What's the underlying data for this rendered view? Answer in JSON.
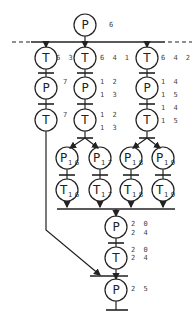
{
  "diagram": {
    "type": "petri-net",
    "top_place": {
      "letter": "P",
      "label": "6"
    },
    "branches": [
      {
        "t1": {
          "letter": "T",
          "label": "6 3"
        },
        "p": {
          "letter": "P",
          "label": "7"
        },
        "t2": {
          "letter": "T",
          "label": "7"
        }
      },
      {
        "t1": {
          "letter": "T",
          "label": "6 4 1"
        },
        "p": {
          "letter": "P",
          "label_lines": [
            "1 2",
            "1 3"
          ]
        },
        "t2": {
          "letter": "T",
          "label_lines": [
            "1 2",
            "1 3"
          ]
        }
      },
      {
        "t1": {
          "letter": "T",
          "label": "6 4 2"
        },
        "p": {
          "letter": "P",
          "label_lines": [
            "1 4",
            "1 5"
          ]
        },
        "t2": {
          "letter": "T",
          "label_lines": [
            "1 4",
            "1 5"
          ]
        }
      }
    ],
    "parallel_places": [
      {
        "letter": "P",
        "sub": "1 6"
      },
      {
        "letter": "P",
        "sub": "1 7"
      },
      {
        "letter": "P",
        "sub": "1 8"
      },
      {
        "letter": "P",
        "sub": "1 9"
      }
    ],
    "parallel_transitions": [
      {
        "letter": "T",
        "sub": "1 6"
      },
      {
        "letter": "T",
        "sub": "1 7"
      },
      {
        "letter": "T",
        "sub": "1 8"
      },
      {
        "letter": "T",
        "sub": "1 9"
      }
    ],
    "join_place": {
      "letter": "P",
      "label_lines": [
        "2 0",
        "2 4"
      ]
    },
    "join_transition": {
      "letter": "T",
      "label_lines": [
        "2 0",
        "2 4"
      ]
    },
    "final_place": {
      "letter": "P",
      "label": "2 5"
    },
    "colors": {
      "stroke": "#222222",
      "background": "#ffffff"
    }
  }
}
